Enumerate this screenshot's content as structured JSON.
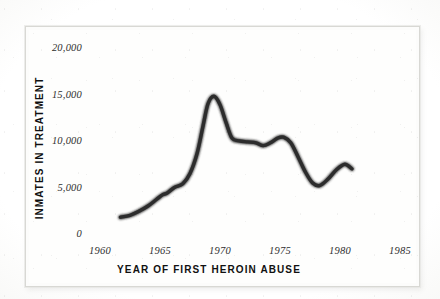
{
  "chart_data": {
    "type": "line",
    "title": "",
    "xlabel": "YEAR OF FIRST HEROIN ABUSE",
    "ylabel": "INMATES IN TREATMENT",
    "xlim": [
      1960,
      1985
    ],
    "ylim": [
      0,
      20000
    ],
    "grid": false,
    "legend": "none",
    "x_tick_labels": [
      "1960",
      "1965",
      "1970",
      "1975",
      "1980",
      "1985"
    ],
    "x_tick_values": [
      1960,
      1965,
      1970,
      1975,
      1980,
      1985
    ],
    "y_tick_labels": [
      "0",
      "5,000",
      "10,000",
      "15,000",
      "20,000"
    ],
    "y_tick_values": [
      0,
      5000,
      10000,
      15000,
      20000
    ],
    "series": [
      {
        "name": "Inmates in treatment",
        "color": "#2c2c2c",
        "x": [
          1961.7,
          1962.5,
          1963.2,
          1964.0,
          1964.7,
          1965.2,
          1965.6,
          1966.2,
          1966.9,
          1967.5,
          1968.1,
          1968.6,
          1969.0,
          1969.5,
          1970.0,
          1970.5,
          1971.0,
          1971.6,
          1972.3,
          1973.0,
          1973.6,
          1974.2,
          1974.8,
          1975.3,
          1975.9,
          1976.5,
          1977.1,
          1977.7,
          1978.3,
          1979.0,
          1979.7,
          1980.4,
          1981.0
        ],
        "y": [
          1700,
          1900,
          2300,
          2900,
          3600,
          4100,
          4300,
          4900,
          5300,
          6400,
          8600,
          11600,
          13900,
          14700,
          13800,
          11900,
          10200,
          9900,
          9800,
          9700,
          9400,
          9700,
          10200,
          10300,
          9700,
          8200,
          6600,
          5400,
          5100,
          5800,
          6800,
          7400,
          6900
        ]
      }
    ],
    "annotations": []
  },
  "figure": {
    "background_color": "#fdfdfc",
    "plate_color": "#fefefd",
    "frame_color": "#d8d8d4",
    "ink_color": "#2c2c2c"
  }
}
